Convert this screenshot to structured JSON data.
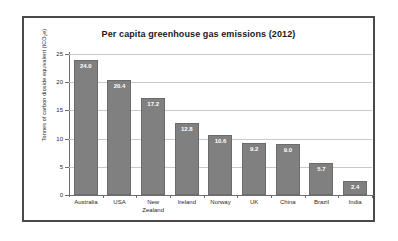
{
  "figure": {
    "frame_color": "#4a4a4a",
    "background": "#ffffff"
  },
  "chart_data": {
    "type": "bar",
    "title": "Per capita greenhouse gas emissions (2012)",
    "xlabel": "",
    "ylabel": "Tonnes of carbon dioxide equivalent (tCO2e)",
    "ylabel_prefix": "Tonnes of carbon dioxide equivalent (tCO",
    "ylabel_sub": "2",
    "ylabel_suffix": "e)",
    "categories": [
      "Australia",
      "USA",
      "New Zealand",
      "Ireland",
      "Norway",
      "UK",
      "China",
      "Brazil",
      "India"
    ],
    "category_lines": [
      [
        "Australia"
      ],
      [
        "USA"
      ],
      [
        "New",
        "Zealand"
      ],
      [
        "Ireland"
      ],
      [
        "Norway"
      ],
      [
        "UK"
      ],
      [
        "China"
      ],
      [
        "Brazil"
      ],
      [
        "India"
      ]
    ],
    "values": [
      24.0,
      20.4,
      17.2,
      12.8,
      10.6,
      9.2,
      9.0,
      5.7,
      2.4
    ],
    "value_labels": [
      "24.0",
      "20.4",
      "17.2",
      "12.8",
      "10.6",
      "9.2",
      "9.0",
      "5.7",
      "2.4"
    ],
    "ylim": [
      0,
      25
    ],
    "ytick_values": [
      0,
      5,
      10,
      15,
      20,
      25
    ],
    "ytick_labels": [
      "0",
      "5",
      "10",
      "15",
      "20",
      "25"
    ],
    "grid": true,
    "grid_axis": "y",
    "legend": false,
    "bar_color": "#808080",
    "bar_border_color": "#6b6b6b",
    "value_label_color": "#ffffff",
    "gridline_color": "#c9c9c9",
    "axis_color": "#6e6e6e"
  }
}
